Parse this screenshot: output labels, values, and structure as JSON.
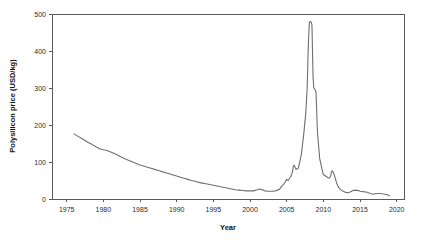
{
  "chart_data": {
    "type": "line",
    "title": "",
    "xlabel": "Year",
    "ylabel": "Polysilicon price (USD/kg)",
    "xlim": [
      1973,
      2021
    ],
    "ylim": [
      0,
      500
    ],
    "grid": false,
    "legend": "none",
    "xticks": [
      1975,
      1980,
      1985,
      1990,
      1995,
      2000,
      2005,
      2010,
      2015,
      2020
    ],
    "yticks": [
      0,
      100,
      200,
      300,
      400,
      500
    ],
    "xtick_labels": [
      "1975",
      "1980",
      "1985",
      "1990",
      "1995",
      "2000",
      "2005",
      "2010",
      "2015",
      "2020"
    ],
    "ytick_labels": [
      "0",
      "100",
      "200",
      "300",
      "400",
      "500"
    ],
    "series": [
      {
        "name": "Polysilicon price",
        "color": "#6e6e6e",
        "x": [
          1976.0,
          1976.5,
          1977.0,
          1977.5,
          1978.0,
          1978.5,
          1979.0,
          1979.5,
          1980.0,
          1980.5,
          1981.0,
          1981.5,
          1982.0,
          1982.5,
          1983.0,
          1983.5,
          1984.0,
          1984.5,
          1985.0,
          1985.5,
          1986.0,
          1986.5,
          1987.0,
          1987.5,
          1988.0,
          1988.5,
          1989.0,
          1989.5,
          1990.0,
          1990.5,
          1991.0,
          1991.5,
          1992.0,
          1992.5,
          1993.0,
          1993.5,
          1994.0,
          1994.5,
          1995.0,
          1995.5,
          1996.0,
          1996.5,
          1997.0,
          1997.5,
          1998.0,
          1998.5,
          1999.0,
          1999.5,
          2000.0,
          2000.5,
          2001.0,
          2001.3,
          2001.8,
          2002.0,
          2002.5,
          2003.0,
          2003.5,
          2004.0,
          2004.3,
          2004.6,
          2004.8,
          2005.0,
          2005.2,
          2005.4,
          2005.6,
          2005.8,
          2005.9,
          2006.0,
          2006.3,
          2006.6,
          2007.0,
          2007.3,
          2007.6,
          2007.8,
          2007.9,
          2008.0,
          2008.1,
          2008.25,
          2008.35,
          2008.45,
          2008.5,
          2008.6,
          2008.7,
          2008.85,
          2009.0,
          2009.2,
          2009.5,
          2009.8,
          2010.0,
          2010.3,
          2010.6,
          2010.8,
          2011.0,
          2011.1,
          2011.25,
          2011.4,
          2011.6,
          2011.8,
          2012.0,
          2012.3,
          2012.6,
          2013.0,
          2013.4,
          2013.8,
          2014.0,
          2014.4,
          2014.8,
          2015.0,
          2015.4,
          2015.8,
          2016.0,
          2016.4,
          2016.8,
          2017.0,
          2017.4,
          2017.8,
          2018.0,
          2018.4,
          2018.8,
          2019.0
        ],
        "y": [
          176,
          170,
          164,
          158,
          152,
          147,
          141,
          136,
          133,
          131,
          127,
          123,
          118,
          113,
          108,
          104,
          100,
          96,
          92,
          89,
          86,
          83,
          80,
          77,
          74,
          71,
          68,
          65,
          62,
          59,
          56,
          53,
          50,
          48,
          45,
          43,
          41,
          39,
          37,
          35,
          33,
          31,
          29,
          27,
          25,
          24,
          23,
          22,
          22,
          22,
          25,
          27,
          24,
          22,
          21,
          21,
          22,
          26,
          34,
          40,
          46,
          53,
          50,
          56,
          62,
          74,
          88,
          92,
          80,
          84,
          120,
          170,
          230,
          300,
          380,
          440,
          478,
          480,
          478,
          470,
          420,
          330,
          300,
          296,
          290,
          180,
          110,
          82,
          66,
          62,
          58,
          56,
          62,
          73,
          76,
          70,
          58,
          44,
          34,
          26,
          22,
          18,
          17,
          20,
          23,
          24,
          23,
          21,
          20,
          19,
          18,
          15,
          13,
          14,
          15,
          15,
          14,
          13,
          11,
          9
        ]
      }
    ]
  },
  "axis": {
    "x_title": "Year",
    "y_title": "Polysilicon price (USD/kg)"
  }
}
